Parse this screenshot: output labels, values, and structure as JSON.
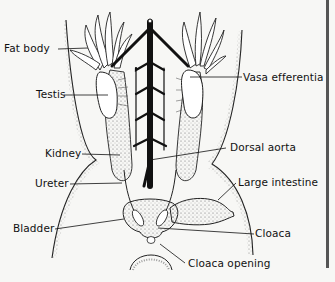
{
  "figure": {
    "colors": {
      "ink": "#111111",
      "paper": "#f7f7f5",
      "stipple": "#777777",
      "rule": "#555555"
    }
  },
  "labels": {
    "fat_body": "Fat body",
    "testis": "Testis",
    "vasa_efferentia": "Vasa efferentia",
    "kidney": "Kidney",
    "dorsal_aorta": "Dorsal aorta",
    "ureter": "Ureter",
    "large_intestine": "Large intestine",
    "bladder": "Bladder",
    "cloaca": "Cloaca",
    "cloaca_opening": "Cloaca opening"
  }
}
